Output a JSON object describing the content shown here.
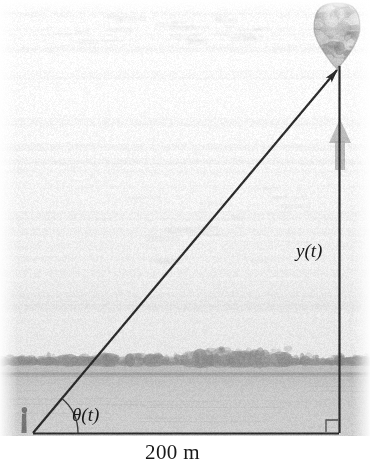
{
  "figure": {
    "kind": "related-rates-diagram",
    "background": {
      "sky_color": "#f0f0f0",
      "sky_top_color": "#fbfbfb",
      "water_color": "#c9c9c9",
      "treeline_color": "#8a8a8a",
      "horizon_y": 372
    },
    "geometry": {
      "vertex_observer": {
        "x": 33,
        "y": 433
      },
      "vertex_corner": {
        "x": 339,
        "y": 433
      },
      "vertex_balloon": {
        "x": 339,
        "y": 68
      },
      "line_color": "#2b2b2b",
      "line_width": 2.2,
      "angle_arc_radius": 45,
      "right_angle_size": 13
    },
    "balloon": {
      "center_x": 337,
      "center_y": 34,
      "width": 46,
      "height": 62,
      "fill_color": "#b4b4b4",
      "highlight_color": "#e2e2e2"
    },
    "motion_arrow": {
      "color": "#a8a8a8",
      "x": 340,
      "y_top": 119,
      "y_bottom": 170,
      "direction": "up"
    }
  },
  "labels": {
    "height": "y(t)",
    "angle": "θ(t)",
    "base_distance": "200 m"
  },
  "icons": {
    "balloon": "hot-air-balloon-icon",
    "observer": "standing-person-icon",
    "up_arrow": "up-arrow-icon",
    "right_angle": "right-angle-marker-icon"
  }
}
